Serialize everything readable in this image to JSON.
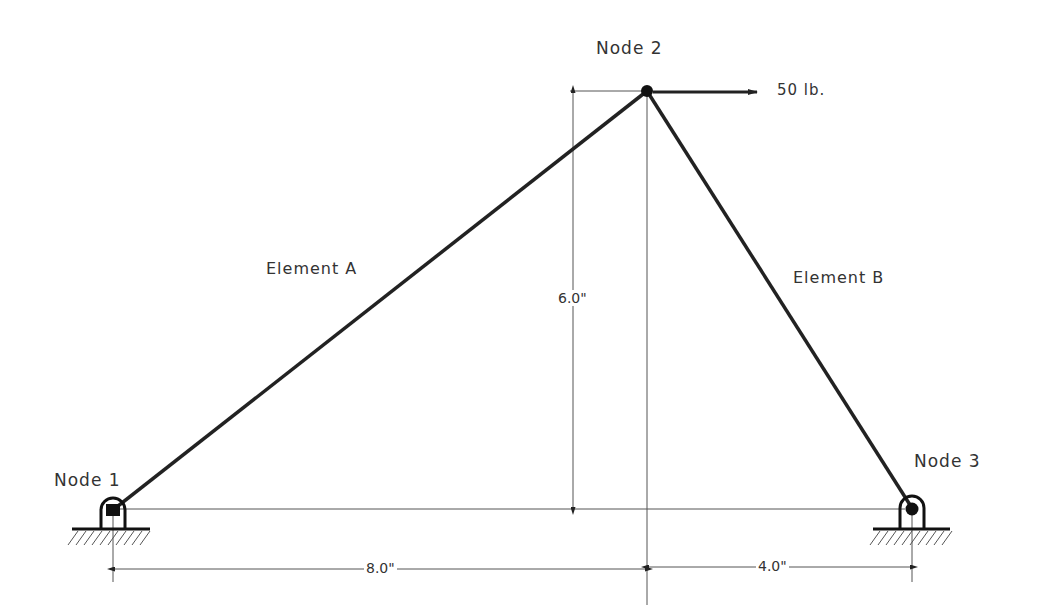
{
  "diagram": {
    "nodes": [
      {
        "id": "node-1",
        "label": "Node 1",
        "support": "pin"
      },
      {
        "id": "node-2",
        "label": "Node 2",
        "support": "free"
      },
      {
        "id": "node-3",
        "label": "Node 3",
        "support": "pin"
      }
    ],
    "elements": [
      {
        "id": "element-a",
        "label": "Element A",
        "from": "node-1",
        "to": "node-2"
      },
      {
        "id": "element-b",
        "label": "Element B",
        "from": "node-2",
        "to": "node-3"
      }
    ],
    "load": {
      "node": "node-2",
      "direction": "right",
      "label": "50 lb."
    },
    "dimensions": {
      "height": "6.0\"",
      "left_span": "8.0\"",
      "right_span": "4.0\""
    },
    "colors": {
      "line": "#222222",
      "thin": "#555555",
      "text": "#333333"
    }
  }
}
